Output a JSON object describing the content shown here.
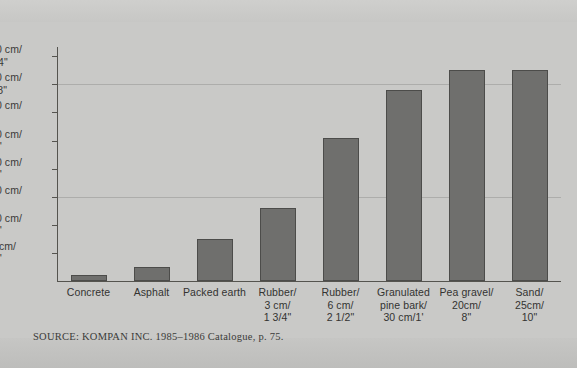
{
  "figure": {
    "source_note": "SOURCE: KOMPAN INC. 1985–1986 Catalogue, p. 75.",
    "clipped_caption_fragment": "",
    "background_color": "#c9c9c7",
    "bar_color": "#6f6f6d",
    "bar_border_color": "#4c4c4a",
    "axis_color": "#55544f"
  },
  "chart_data": {
    "type": "bar",
    "title": "",
    "subtitle": "",
    "xlabel": "",
    "ylabel": "",
    "ylim": [
      0,
      420
    ],
    "grid": true,
    "legend": "none",
    "orientation": "vertical",
    "units": "cm (with feet/inches equivalent)",
    "categories": [
      "Concrete",
      "Asphalt",
      "Packed earth",
      "Rubber/\n3 cm/\n1 3/4\"",
      "Rubber/\n6 cm/\n2 1/2\"",
      "Granulated\npine bark/\n30 cm/1'",
      "Pea gravel/\n20cm/\n8\"",
      "Sand/\n25cm/\n10\""
    ],
    "values": [
      10,
      25,
      75,
      130,
      255,
      340,
      375,
      375
    ],
    "yticks": [
      50,
      100,
      150,
      200,
      250,
      300,
      350,
      400
    ],
    "ytick_labels": [
      "50 cm/\n1'8\"",
      "100 cm/\n3'4\"",
      "150 cm/\n5'",
      "200 cm/\n6'8\"",
      "250 cm/\n8'4\"",
      "300 cm/\n10'",
      "350 cm/\n11'8\"",
      "400 cm/\n13'4\""
    ],
    "gridlines_at": [
      350,
      150
    ]
  }
}
